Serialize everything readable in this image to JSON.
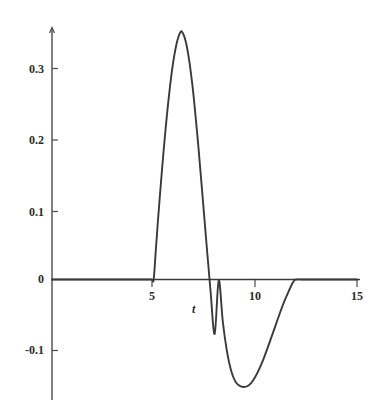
{
  "chart_data": {
    "type": "line",
    "title": "",
    "subtitle": "",
    "xlabel": "t",
    "ylabel": "",
    "xlim": [
      0,
      15
    ],
    "ylim": [
      -0.175,
      0.38
    ],
    "grid": false,
    "legend": null,
    "annotations": [],
    "x_ticks": [
      {
        "value": 5,
        "label": "5"
      },
      {
        "value": 10,
        "label": "10"
      },
      {
        "value": 15,
        "label": "15"
      }
    ],
    "y_ticks": [
      {
        "value": 0.3,
        "label": "0.3"
      },
      {
        "value": 0.2,
        "label": "0.2"
      },
      {
        "value": 0.1,
        "label": "0.1"
      },
      {
        "value": 0,
        "label": "0"
      },
      {
        "value": -0.1,
        "label": "-0.1"
      }
    ],
    "series": [
      {
        "name": "f(t)",
        "color": "#3a3a3a",
        "x": [
          0.0,
          0.5,
          1.0,
          1.5,
          2.0,
          2.5,
          3.0,
          3.5,
          4.0,
          4.5,
          4.9,
          5.0,
          5.1,
          5.2,
          5.3,
          5.4,
          5.5,
          5.6,
          5.7,
          5.8,
          5.9,
          6.0,
          6.1,
          6.2,
          6.3,
          6.35,
          6.4,
          6.5,
          6.6,
          6.7,
          6.8,
          6.9,
          7.0,
          7.2,
          7.4,
          7.6,
          7.8,
          8.0,
          8.2,
          8.4,
          8.6,
          8.8,
          9.0,
          9.2,
          9.4,
          9.6,
          9.8,
          10.0,
          10.2,
          10.4,
          10.6,
          10.8,
          11.0,
          11.2,
          11.4,
          11.6,
          11.8,
          11.9,
          12.0,
          12.5,
          13.0,
          13.5,
          14.0,
          14.5,
          15.0
        ],
        "y": [
          0.0,
          0.0,
          0.0,
          0.0,
          0.0,
          0.0,
          0.0,
          0.0,
          0.0,
          0.0,
          0.0,
          0.0,
          0.041,
          0.082,
          0.121,
          0.158,
          0.193,
          0.226,
          0.256,
          0.283,
          0.307,
          0.327,
          0.343,
          0.355,
          0.363,
          0.365,
          0.364,
          0.358,
          0.347,
          0.331,
          0.311,
          0.287,
          0.259,
          0.195,
          0.124,
          0.052,
          -0.018,
          -0.08,
          -0.001,
          -0.062,
          -0.105,
          -0.133,
          -0.149,
          -0.156,
          -0.158,
          -0.157,
          -0.152,
          -0.143,
          -0.131,
          -0.117,
          -0.101,
          -0.084,
          -0.067,
          -0.05,
          -0.034,
          -0.02,
          -0.007,
          -0.002,
          0.0,
          0.0,
          0.0,
          0.0,
          0.0,
          0.0,
          0.0
        ]
      }
    ]
  },
  "axis": {
    "x_label_text": "t",
    "y_labels": [
      "0.3",
      "0.2",
      "0.1",
      "0",
      "-0.1"
    ],
    "x_labels": [
      "5",
      "10",
      "15"
    ]
  }
}
